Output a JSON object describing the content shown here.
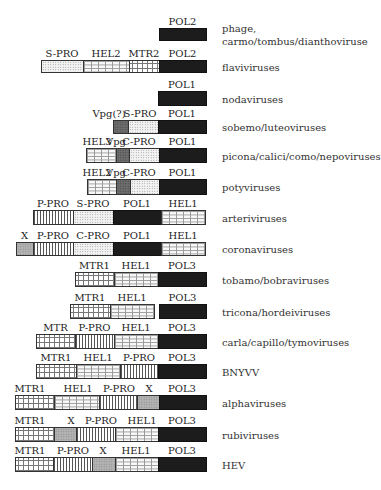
{
  "diagram": {
    "type": "genome-organization",
    "right_label_x": 222,
    "rows": [
      {
        "name": "phage-carmo-tombus-diantho",
        "virus_label": [
          "phage,",
          "carmo/tombus/dianthoviruse"
        ],
        "label_y": [
          22,
          35
        ],
        "box_top": 28,
        "box_bottom": 41,
        "segments": [
          {
            "label": "POL2",
            "type": "POL",
            "x0": 159,
            "x1": 206
          }
        ]
      },
      {
        "name": "flaviviruses",
        "virus_label": [
          "flaviviruses"
        ],
        "label_y": [
          61
        ],
        "box_top": 60,
        "box_bottom": 73,
        "segments": [
          {
            "label": "S-PRO",
            "type": "S",
            "x0": 41,
            "x1": 83
          },
          {
            "label": "HEL2",
            "type": "HEL",
            "x0": 83,
            "x1": 129
          },
          {
            "label": "MTR2",
            "type": "MTR",
            "x0": 129,
            "x1": 159
          },
          {
            "label": "POL2",
            "type": "POL",
            "x0": 159,
            "x1": 206
          }
        ]
      },
      {
        "name": "nodaviruses",
        "virus_label": [
          "nodaviruses"
        ],
        "label_y": [
          93
        ],
        "box_top": 91,
        "box_bottom": 106,
        "segments": [
          {
            "label": "POL1",
            "type": "POL",
            "x0": 158,
            "x1": 206
          }
        ]
      },
      {
        "name": "sobemo-luteoviruses",
        "virus_label": [
          "sobemo/luteoviruses"
        ],
        "label_y": [
          122
        ],
        "box_top": 120,
        "box_bottom": 134,
        "segments": [
          {
            "label": "Vpg(?)",
            "type": "VPG",
            "x0": 113,
            "x1": 128,
            "label_cx": 109
          },
          {
            "label": "S-PRO",
            "type": "S",
            "x0": 128,
            "x1": 158,
            "label_cx": 140
          },
          {
            "label": "POL1",
            "type": "POL",
            "x0": 158,
            "x1": 206
          }
        ]
      },
      {
        "name": "picona-calici-como-nepoviruses",
        "virus_label": [
          "picona/calici/como/nepoviruses"
        ],
        "label_y": [
          152
        ],
        "box_top": 148,
        "box_bottom": 163,
        "segments": [
          {
            "label": "HEL3",
            "type": "HEL",
            "x0": 86,
            "x1": 116,
            "label_cx": 97
          },
          {
            "label": "Vpg",
            "type": "VPG",
            "x0": 116,
            "x1": 129,
            "label_cx": 116
          },
          {
            "label": "C-PRO",
            "type": "C",
            "x0": 129,
            "x1": 159,
            "label_cx": 139
          },
          {
            "label": "POL1",
            "type": "POL",
            "x0": 159,
            "x1": 206
          }
        ]
      },
      {
        "name": "potyviruses",
        "virus_label": [
          "potyviruses"
        ],
        "label_y": [
          184
        ],
        "box_top": 179,
        "box_bottom": 195,
        "segments": [
          {
            "label": "HEL2",
            "type": "HEL",
            "x0": 87,
            "x1": 116,
            "label_cx": 97
          },
          {
            "label": "Vpg",
            "type": "VPG",
            "x0": 116,
            "x1": 130,
            "label_cx": 116
          },
          {
            "label": "C-PRO",
            "type": "C",
            "x0": 130,
            "x1": 159,
            "label_cx": 139
          },
          {
            "label": "POL1",
            "type": "POL",
            "x0": 159,
            "x1": 206
          }
        ]
      },
      {
        "name": "arteriviruses",
        "virus_label": [
          "arteriviruses"
        ],
        "label_y": [
          212
        ],
        "box_top": 210,
        "box_bottom": 225,
        "segments": [
          {
            "label": "P-PRO",
            "type": "P",
            "x0": 33,
            "x1": 73
          },
          {
            "label": "S-PRO",
            "type": "S",
            "x0": 73,
            "x1": 113
          },
          {
            "label": "POL1",
            "type": "POL",
            "x0": 113,
            "x1": 161
          },
          {
            "label": "HEL1",
            "type": "HEL",
            "x0": 161,
            "x1": 205
          }
        ]
      },
      {
        "name": "coronaviruses",
        "virus_label": [
          "coronaviruses"
        ],
        "label_y": [
          244
        ],
        "box_top": 242,
        "box_bottom": 256,
        "segments": [
          {
            "label": "X",
            "type": "X",
            "x0": 16,
            "x1": 33
          },
          {
            "label": "P-PRO",
            "type": "P",
            "x0": 33,
            "x1": 73
          },
          {
            "label": "C-PRO",
            "type": "C",
            "x0": 73,
            "x1": 113
          },
          {
            "label": "POL1",
            "type": "POL",
            "x0": 113,
            "x1": 161
          },
          {
            "label": "HEL1",
            "type": "HEL",
            "x0": 161,
            "x1": 205
          }
        ]
      },
      {
        "name": "tobamo-bobraviruses",
        "virus_label": [
          "tobamo/bobraviruses"
        ],
        "label_y": [
          273
        ],
        "box_top": 272,
        "box_bottom": 287,
        "segments": [
          {
            "label": "MTR1",
            "type": "MTR",
            "x0": 75,
            "x1": 114
          },
          {
            "label": "HEL1",
            "type": "HEL",
            "x0": 114,
            "x1": 158
          },
          {
            "label": "POL3",
            "type": "POL",
            "x0": 158,
            "x1": 206
          }
        ]
      },
      {
        "name": "tricona-hordeiviruses",
        "virus_label": [
          "tricona/hordeiviruses"
        ],
        "label_y": [
          306
        ],
        "box_top": 304,
        "box_bottom": 319,
        "segments": [
          {
            "label": "MTR1",
            "type": "MTR",
            "x0": 70,
            "x1": 110
          },
          {
            "label": "HEL1",
            "type": "HEL",
            "x0": 110,
            "x1": 154
          },
          {
            "label": "POL3",
            "type": "POL",
            "x0": 159,
            "x1": 206
          }
        ]
      },
      {
        "name": "carla-capillo-tymoviruses",
        "virus_label": [
          "carla/capillo/tymoviruses"
        ],
        "label_y": [
          336
        ],
        "box_top": 334,
        "box_bottom": 349,
        "segments": [
          {
            "label": "MTR",
            "type": "MTR",
            "x0": 36,
            "x1": 75
          },
          {
            "label": "P-PRO",
            "type": "P",
            "x0": 75,
            "x1": 114
          },
          {
            "label": "HEL1",
            "type": "HEL",
            "x0": 114,
            "x1": 158
          },
          {
            "label": "POL3",
            "type": "POL",
            "x0": 158,
            "x1": 206
          }
        ]
      },
      {
        "name": "bnyvv",
        "virus_label": [
          "BNYVV"
        ],
        "label_y": [
          366
        ],
        "box_top": 364,
        "box_bottom": 379,
        "segments": [
          {
            "label": "MTR1",
            "type": "MTR",
            "x0": 36,
            "x1": 76
          },
          {
            "label": "HEL1",
            "type": "HEL",
            "x0": 76,
            "x1": 120
          },
          {
            "label": "P-PRO",
            "type": "P",
            "x0": 120,
            "x1": 158
          },
          {
            "label": "POL3",
            "type": "POL",
            "x0": 158,
            "x1": 206
          }
        ]
      },
      {
        "name": "alphaviruses",
        "virus_label": [
          "alphaviruses"
        ],
        "label_y": [
          396
        ],
        "box_top": 395,
        "box_bottom": 410,
        "segments": [
          {
            "label": "MTR1",
            "type": "MTR",
            "x0": 15,
            "x1": 54,
            "label_cx": 30
          },
          {
            "label": "HEL1",
            "type": "HEL",
            "x0": 54,
            "x1": 99,
            "label_cx": 78
          },
          {
            "label": "P-PRO",
            "type": "P",
            "x0": 99,
            "x1": 137,
            "label_cx": 119
          },
          {
            "label": "X",
            "type": "X",
            "x0": 137,
            "x1": 159,
            "label_cx": 149
          },
          {
            "label": "POL3",
            "type": "POL",
            "x0": 159,
            "x1": 206,
            "label_cx": 182
          }
        ]
      },
      {
        "name": "rubiviruses",
        "virus_label": [
          "rubiviruses"
        ],
        "label_y": [
          428
        ],
        "box_top": 427,
        "box_bottom": 442,
        "segments": [
          {
            "label": "MTR1",
            "type": "MTR",
            "x0": 15,
            "x1": 54,
            "label_cx": 30
          },
          {
            "label": "X",
            "type": "X",
            "x0": 54,
            "x1": 76,
            "label_cx": 71
          },
          {
            "label": "P-PRO",
            "type": "P",
            "x0": 76,
            "x1": 115,
            "label_cx": 101
          },
          {
            "label": "HEL1",
            "type": "HEL",
            "x0": 115,
            "x1": 158,
            "label_cx": 142
          },
          {
            "label": "POL3",
            "type": "POL",
            "x0": 158,
            "x1": 206,
            "label_cx": 182
          }
        ]
      },
      {
        "name": "hev",
        "virus_label": [
          "HEV"
        ],
        "label_y": [
          460
        ],
        "box_top": 457,
        "box_bottom": 472,
        "segments": [
          {
            "label": "MTR1",
            "type": "MTR",
            "x0": 15,
            "x1": 53,
            "label_cx": 30
          },
          {
            "label": "P-PRO",
            "type": "P",
            "x0": 53,
            "x1": 92,
            "label_cx": 73
          },
          {
            "label": "X",
            "type": "X",
            "x0": 92,
            "x1": 115,
            "label_cx": 103
          },
          {
            "label": "HEL1",
            "type": "HEL",
            "x0": 115,
            "x1": 158,
            "label_cx": 136
          },
          {
            "label": "POL3",
            "type": "POL",
            "x0": 158,
            "x1": 206,
            "label_cx": 182
          }
        ]
      }
    ]
  },
  "legend_patterns": {
    "POL": "solid black",
    "S-PRO/C-PRO": "fine light stipple",
    "HEL": "brick",
    "MTR": "cross grid",
    "P-PRO": "vertical lines",
    "X": "gray stipple",
    "Vpg": "dark gray stipple"
  }
}
